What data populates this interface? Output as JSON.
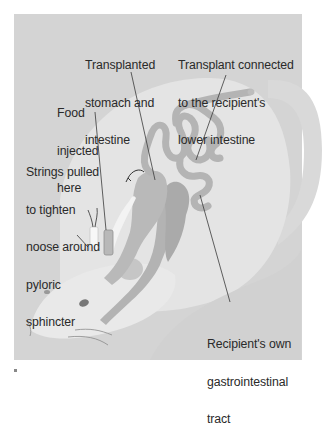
{
  "figure": {
    "type": "anatomical-diagram",
    "colors": {
      "background": "#ffffff",
      "panel": "#d4d4d4",
      "rat_body": "#e8e8e8",
      "organs": "#b8b8b8",
      "organ_outline": "#a4a4a4",
      "recipient_gi": "#adadad",
      "food_tube": "#f4f4f4",
      "text": "#2a2a2a",
      "leader_line": "#3a3a3a"
    }
  },
  "labels": {
    "transplanted": {
      "lines": [
        "Transplanted",
        "stomach and",
        "intestine"
      ]
    },
    "connected": {
      "lines": [
        "Transplant connected",
        "to the recipient's",
        "lower intestine"
      ]
    },
    "food": {
      "lines": [
        "Food",
        "injected",
        "here"
      ]
    },
    "strings": {
      "lines": [
        "Strings pulled",
        "to tighten",
        "noose around",
        "pyloric",
        "sphincter"
      ]
    },
    "recipient": {
      "lines": [
        "Recipient's own",
        "gastrointestinal",
        "tract"
      ]
    }
  }
}
